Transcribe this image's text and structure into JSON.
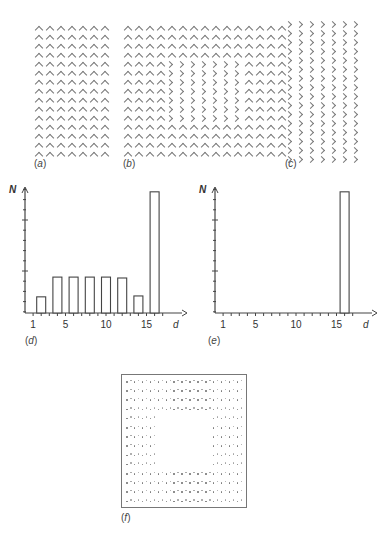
{
  "panels": {
    "a": {
      "label": "a",
      "description": "Uniform texture of upward-pointing chevrons",
      "cols": 7,
      "rows": 15,
      "element": "^"
    },
    "b": {
      "label": "b",
      "description": "Chevron texture with a central square region of rotated chevrons",
      "cols": 15,
      "rows": 15,
      "element": "^",
      "inset_element": ">",
      "inset_rows": [
        4,
        10
      ],
      "inset_cols": [
        4,
        10
      ]
    },
    "c": {
      "label": "c",
      "description": "Uniform texture of right-pointing chevrons",
      "cols": 7,
      "rows": 16,
      "element": ">"
    },
    "f": {
      "label": "f",
      "description": "Dot map with empty central region corresponding to the texture boundary",
      "rows": 14,
      "cols": 15,
      "empty_rows": [
        4,
        9
      ],
      "empty_cols": [
        4,
        10
      ]
    }
  },
  "chart_data": [
    {
      "id": "d",
      "label": "d",
      "type": "bar",
      "title": "",
      "xlabel": "d",
      "ylabel": "N",
      "x_ticks": [
        1,
        5,
        10,
        15
      ],
      "x_minor_ticks": [
        1,
        2,
        3,
        4,
        5,
        6,
        7,
        8,
        9,
        10,
        11,
        12,
        13,
        14,
        15,
        16,
        17
      ],
      "x_range": [
        0,
        18
      ],
      "ylim": [
        0,
        13
      ],
      "y_major_ticks": [
        5,
        10
      ],
      "categories": [
        2,
        4,
        6,
        8,
        10,
        12,
        14,
        16
      ],
      "values": [
        1.8,
        4,
        4,
        4,
        4,
        3.9,
        1.9,
        13.5
      ],
      "grid": false,
      "legend": null
    },
    {
      "id": "e",
      "label": "e",
      "type": "bar",
      "title": "",
      "xlabel": "d",
      "ylabel": "N",
      "x_ticks": [
        1,
        5,
        10,
        15
      ],
      "x_minor_ticks": [
        1,
        2,
        3,
        4,
        5,
        6,
        7,
        8,
        9,
        10,
        11,
        12,
        13,
        14,
        15,
        16,
        17
      ],
      "x_range": [
        0,
        18
      ],
      "ylim": [
        0,
        13
      ],
      "y_major_ticks": [
        5,
        10
      ],
      "categories": [
        16
      ],
      "values": [
        13.5
      ],
      "grid": false,
      "legend": null
    }
  ],
  "captions": {
    "a": "a",
    "b": "b",
    "c": "c",
    "d": "d",
    "e": "e",
    "f": "f"
  },
  "axis": {
    "y_label": "N",
    "x_label": "d",
    "tick_labels": [
      "1",
      "5",
      "10",
      "15"
    ]
  }
}
